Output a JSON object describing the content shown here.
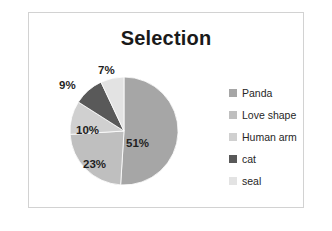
{
  "chart_data": {
    "type": "pie",
    "title": "Selection",
    "categories": [
      "Panda",
      "Love shape",
      "Human arm",
      "cat",
      "seal"
    ],
    "values": [
      51,
      23,
      10,
      9,
      7
    ],
    "value_labels": [
      "51%",
      "23%",
      "10%",
      "9%",
      "7%"
    ],
    "unit": "%",
    "colors": [
      "#a6a6a6",
      "#bfbfbf",
      "#d0d0d0",
      "#595959",
      "#e3e3e3"
    ],
    "legend_position": "right",
    "grid": false,
    "start_angle_deg": 0,
    "direction": "clockwise",
    "label_placement": [
      "inside",
      "inside",
      "inside",
      "outside",
      "outside"
    ]
  },
  "frame": {
    "border_color": "#d2d2d2",
    "background": "#ffffff"
  },
  "title": {
    "text": "Selection",
    "color": "#1a1a1a"
  },
  "legend": {
    "items": [
      {
        "label": "Panda",
        "color": "#a6a6a6"
      },
      {
        "label": "Love shape",
        "color": "#bfbfbf"
      },
      {
        "label": "Human arm",
        "color": "#d0d0d0"
      },
      {
        "label": "cat",
        "color": "#595959"
      },
      {
        "label": "seal",
        "color": "#e3e3e3"
      }
    ]
  },
  "labels": [
    {
      "text": "51%",
      "left": 126,
      "top": 137
    },
    {
      "text": "23%",
      "left": 83,
      "top": 158
    },
    {
      "text": "10%",
      "left": 76,
      "top": 124
    },
    {
      "text": "9%",
      "left": 59,
      "top": 79
    },
    {
      "text": "7%",
      "left": 98,
      "top": 64
    }
  ]
}
